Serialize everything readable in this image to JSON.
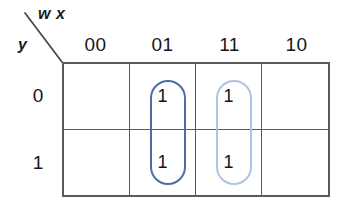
{
  "diagram": {
    "type": "karnaugh-map",
    "column_variables_label": "w x",
    "row_variable_label": "y",
    "column_headers": [
      "00",
      "01",
      "11",
      "10"
    ],
    "row_headers": [
      "0",
      "1"
    ],
    "cells": [
      {
        "row": "0",
        "col": "00",
        "value": ""
      },
      {
        "row": "0",
        "col": "01",
        "value": "1"
      },
      {
        "row": "0",
        "col": "11",
        "value": "1"
      },
      {
        "row": "0",
        "col": "10",
        "value": ""
      },
      {
        "row": "1",
        "col": "00",
        "value": ""
      },
      {
        "row": "1",
        "col": "01",
        "value": "1"
      },
      {
        "row": "1",
        "col": "11",
        "value": "1"
      },
      {
        "row": "1",
        "col": "10",
        "value": ""
      }
    ],
    "groups": [
      {
        "name": "group-column-01",
        "covers_column": "01",
        "covers_rows": [
          "0",
          "1"
        ],
        "color": "#4a6fa5"
      },
      {
        "name": "group-column-11",
        "covers_column": "11",
        "covers_rows": [
          "0",
          "1"
        ],
        "color": "#aec4e0"
      }
    ],
    "colors": {
      "grid_line": "#5a5a5a",
      "text": "#171717",
      "background": "#ffffff",
      "group_dark_blue": "#4a6fa5",
      "group_light_blue": "#aec4e0"
    }
  }
}
